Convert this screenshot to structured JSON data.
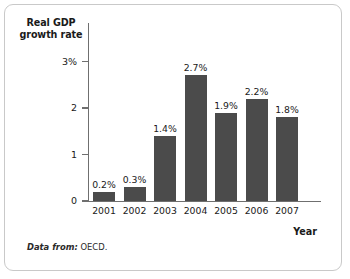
{
  "figure": {
    "caption_prefix": "Data from:",
    "caption_source": "OECD."
  },
  "chart_data": {
    "type": "bar",
    "title": "",
    "subtitle": "",
    "xlabel": "Year",
    "ylabel": "Real GDP growth rate",
    "categories": [
      "2001",
      "2002",
      "2003",
      "2004",
      "2005",
      "2006",
      "2007"
    ],
    "values": [
      0.2,
      0.3,
      1.4,
      2.7,
      1.9,
      2.2,
      1.8
    ],
    "value_labels": [
      "0.2%",
      "0.3%",
      "1.4%",
      "2.7%",
      "1.9%",
      "2.2%",
      "1.8%"
    ],
    "ylim": [
      0,
      3
    ],
    "yticks": [
      0,
      1,
      2,
      3
    ],
    "ytick_labels": [
      "0",
      "1",
      "2",
      "3%"
    ],
    "grid": false,
    "legend": false,
    "bar_color": "#4b4b4b",
    "axis_color": "#6f6f6f",
    "text_color": "#1a1a1a",
    "border_color": "#c9c9c9",
    "background_color": "#ffffff"
  }
}
